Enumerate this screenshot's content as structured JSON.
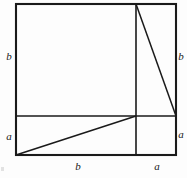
{
  "figure": {
    "background_color": "#fdfdfd",
    "stroke_color": "#1a1a1a",
    "outer_square": {
      "left": 16,
      "top": 4,
      "right": 176,
      "bottom": 155,
      "stroke_width": 2.1
    },
    "horizontal_divider": {
      "x1": 16,
      "y1": 116,
      "x2": 176,
      "y2": 116,
      "stroke_width": 1.6
    },
    "vertical_divider": {
      "x1": 136,
      "y1": 4,
      "x2": 136,
      "y2": 155,
      "stroke_width": 1.6
    },
    "diagonal_upper_right": {
      "x1": 136,
      "y1": 4,
      "x2": 176,
      "y2": 116,
      "stroke_width": 1.5
    },
    "diagonal_lower_left": {
      "x1": 16,
      "y1": 155,
      "x2": 136,
      "y2": 116,
      "stroke_width": 1.5
    },
    "labels": [
      {
        "id": "left-upper",
        "text": "b",
        "x": 9,
        "y": 56
      },
      {
        "id": "left-lower",
        "text": "a",
        "x": 9,
        "y": 136
      },
      {
        "id": "right-upper",
        "text": "b",
        "x": 181,
        "y": 56
      },
      {
        "id": "right-lower",
        "text": "a",
        "x": 181,
        "y": 134
      },
      {
        "id": "bottom-left",
        "text": "b",
        "x": 78,
        "y": 166
      },
      {
        "id": "bottom-right",
        "text": "a",
        "x": 157,
        "y": 166
      }
    ]
  }
}
